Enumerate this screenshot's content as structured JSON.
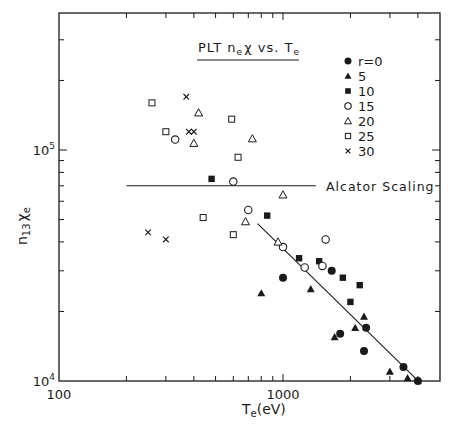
{
  "chart_data": {
    "type": "scatter",
    "title_parts": {
      "a": "PLT n",
      "a_sub": "e",
      "b": "χ vs. T",
      "b_sub": "e"
    },
    "xlabel": "T_e(eV)",
    "xlabel_parts": {
      "main": "T",
      "sub": "e",
      "rest": "(eV)"
    },
    "ylabel": "n_13 χ_e",
    "ylabel_parts": {
      "n": "n",
      "n_sub": "13",
      "chi": "χ",
      "chi_sub": "e"
    },
    "xscale": "log",
    "yscale": "log",
    "xlim": [
      100,
      4700
    ],
    "ylim": [
      10000,
      390000
    ],
    "x_tick_labels": [
      {
        "value": 100,
        "text": "100"
      },
      {
        "value": 1000,
        "text": "1000"
      }
    ],
    "y_tick_labels": [
      {
        "value": 10000,
        "base": "10",
        "exp": "4"
      },
      {
        "value": 100000,
        "base": "10",
        "exp": "5"
      }
    ],
    "legend": {
      "position": "upper right",
      "entries": [
        {
          "label": "r=0",
          "marker": "filled-circle"
        },
        {
          "label": "5",
          "marker": "filled-triangle"
        },
        {
          "label": "10",
          "marker": "filled-square"
        },
        {
          "label": "15",
          "marker": "open-circle"
        },
        {
          "label": "20",
          "marker": "open-triangle"
        },
        {
          "label": "25",
          "marker": "open-square"
        },
        {
          "label": "30",
          "marker": "cross"
        }
      ]
    },
    "series": [
      {
        "name": "r=0",
        "marker": "filled-circle",
        "points": [
          [
            1000,
            28000
          ],
          [
            1650,
            30000
          ],
          [
            2350,
            17000
          ],
          [
            1800,
            16000
          ],
          [
            2300,
            13500
          ],
          [
            3450,
            11500
          ],
          [
            4000,
            10000
          ]
        ]
      },
      {
        "name": "5",
        "marker": "filled-triangle",
        "points": [
          [
            800,
            24000
          ],
          [
            1330,
            25000
          ],
          [
            1700,
            15500
          ],
          [
            2100,
            17000
          ],
          [
            2300,
            19000
          ],
          [
            3000,
            11000
          ],
          [
            3600,
            10300
          ]
        ]
      },
      {
        "name": "10",
        "marker": "filled-square",
        "points": [
          [
            480,
            75000
          ],
          [
            850,
            52000
          ],
          [
            1180,
            34000
          ],
          [
            1450,
            33000
          ],
          [
            1850,
            28000
          ],
          [
            2000,
            22000
          ],
          [
            2200,
            26000
          ]
        ]
      },
      {
        "name": "15",
        "marker": "open-circle",
        "points": [
          [
            330,
            111000
          ],
          [
            600,
            73000
          ],
          [
            700,
            55000
          ],
          [
            1000,
            38000
          ],
          [
            1250,
            31000
          ],
          [
            1500,
            31500
          ],
          [
            1550,
            41000
          ]
        ]
      },
      {
        "name": "20",
        "marker": "open-triangle",
        "points": [
          [
            420,
            145000
          ],
          [
            400,
            107000
          ],
          [
            730,
            112000
          ],
          [
            1000,
            64000
          ],
          [
            680,
            49000
          ],
          [
            950,
            40000
          ]
        ]
      },
      {
        "name": "25",
        "marker": "open-square",
        "points": [
          [
            260,
            160000
          ],
          [
            300,
            120000
          ],
          [
            590,
            136000
          ],
          [
            630,
            93000
          ],
          [
            440,
            51000
          ],
          [
            600,
            43000
          ]
        ]
      },
      {
        "name": "30",
        "marker": "cross",
        "points": [
          [
            370,
            170000
          ],
          [
            380,
            120000
          ],
          [
            400,
            120000
          ],
          [
            250,
            44000
          ],
          [
            300,
            41000
          ]
        ]
      }
    ],
    "reference_lines": [
      {
        "name": "Alcator Scaling",
        "type": "horizontal",
        "y": 70000,
        "x_from": 200,
        "x_to": 1400,
        "label": "Alcator Scaling"
      },
      {
        "name": "fit",
        "type": "line",
        "from": [
          770,
          48000
        ],
        "to": [
          4150,
          9700
        ]
      }
    ],
    "grid": false
  }
}
